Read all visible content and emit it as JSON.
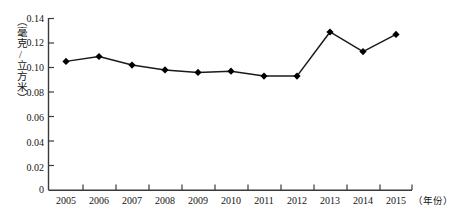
{
  "chart_data": {
    "type": "line",
    "title": "",
    "subtitle": "",
    "xlabel": "年份",
    "ylabel": "（毫克/立方米）",
    "categories": [
      "2005",
      "2006",
      "2007",
      "2008",
      "2009",
      "2010",
      "2011",
      "2012",
      "2013",
      "2014",
      "2015"
    ],
    "x": [
      2005,
      2006,
      2007,
      2008,
      2009,
      2010,
      2011,
      2012,
      2013,
      2014,
      2015
    ],
    "values": [
      0.105,
      0.109,
      0.102,
      0.098,
      0.096,
      0.097,
      0.093,
      0.093,
      0.129,
      0.113,
      0.127
    ],
    "series": [
      {
        "name": "",
        "values": [
          0.105,
          0.109,
          0.102,
          0.098,
          0.096,
          0.097,
          0.093,
          0.093,
          0.129,
          0.113,
          0.127
        ]
      }
    ],
    "ylim": [
      0,
      0.14
    ],
    "xlim": [
      2005,
      2015
    ],
    "yticks": [
      0,
      0.02,
      0.04,
      0.06,
      0.08,
      0.1,
      0.12,
      0.14
    ],
    "ytick_labels": [
      "0",
      "0.02",
      "0.04",
      "0.06",
      "0.08",
      "0.10",
      "0.12",
      "0.14"
    ],
    "xtick_labels": [
      "2005",
      "2006",
      "2007",
      "2008",
      "2009",
      "2010",
      "2011",
      "2012",
      "2013",
      "2014",
      "2015"
    ],
    "grid": false,
    "legend": "none",
    "marker": "diamond",
    "line_color": "#1a1a1a",
    "marker_color": "#000000",
    "axis_color": "#3a3a3a",
    "background_color": "#ffffff"
  },
  "axes": {
    "y_title": "（毫克/立方米）",
    "x_unit": "（年份）",
    "y_labels": {
      "t0": "0",
      "t1": "0.02",
      "t2": "0.04",
      "t3": "0.06",
      "t4": "0.08",
      "t5": "0.10",
      "t6": "0.12",
      "t7": "0.14"
    },
    "x_labels": {
      "y2005": "2005",
      "y2006": "2006",
      "y2007": "2007",
      "y2008": "2008",
      "y2009": "2009",
      "y2010": "2010",
      "y2011": "2011",
      "y2012": "2012",
      "y2013": "2013",
      "y2014": "2014",
      "y2015": "2015"
    }
  }
}
